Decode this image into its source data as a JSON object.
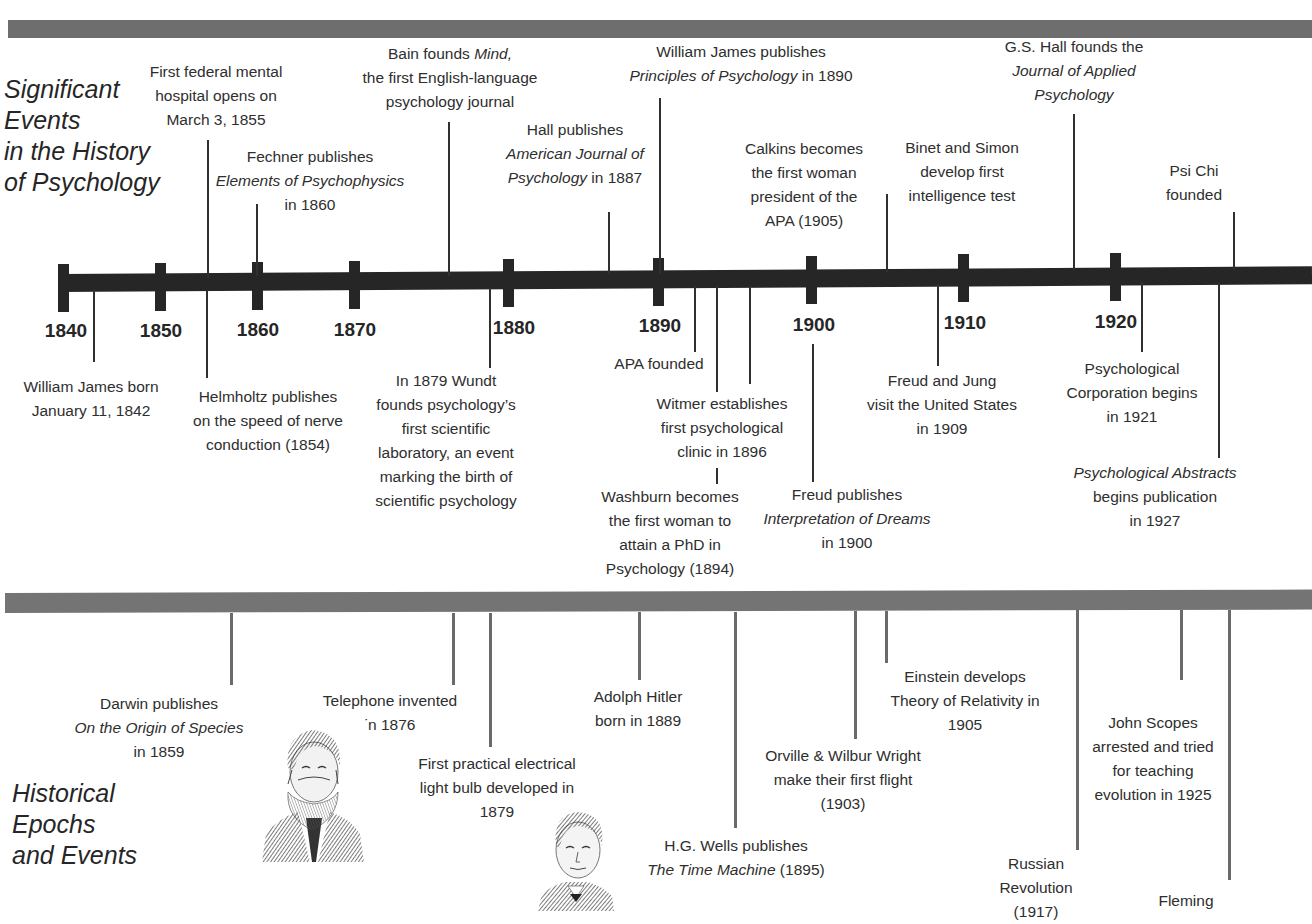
{
  "titles": {
    "psychology": "Significant\nEvents\nin the History\nof Psychology",
    "historical": "Historical\nEpochs\nand Events"
  },
  "colors": {
    "axis": "#262626",
    "band": "#6e6e6e",
    "connector": "#303030",
    "connector_historical": "#6a6a6a",
    "text": "#2e2e2e"
  },
  "chart_data": {
    "type": "timeline",
    "title": "Significant Events in the History of Psychology",
    "axis": {
      "ticks": [
        "1840",
        "1850",
        "1860",
        "1870",
        "1880",
        "1890",
        "1900",
        "1910",
        "1920"
      ],
      "range": [
        1840,
        1930
      ]
    },
    "psychology_events_above": [
      {
        "year": 1855,
        "lines": [
          "First federal mental",
          "hospital opens on",
          "March 3, 1855"
        ]
      },
      {
        "year": 1860,
        "lines": [
          "Fechner publishes",
          "<i>Elements of Psychophysics</i>",
          "in 1860"
        ]
      },
      {
        "year": 1876,
        "lines": [
          "Bain founds <i>Mind,</i>",
          "the first English-language",
          "psychology journal"
        ]
      },
      {
        "year": 1887,
        "lines": [
          "Hall publishes",
          "<i>American Journal of</i>",
          "<i>Psychology</i> in 1887"
        ]
      },
      {
        "year": 1890,
        "lines": [
          "William James publishes",
          "<i>Principles of Psychology</i> in 1890"
        ]
      },
      {
        "year": 1905,
        "lines": [
          "Calkins becomes",
          "the first woman",
          "president of the",
          "APA (1905)"
        ]
      },
      {
        "year": 1905,
        "lines": [
          "Binet and Simon",
          "develop first",
          "intelligence test"
        ]
      },
      {
        "year": 1917,
        "lines": [
          "G.S. Hall founds the",
          "<i>Journal of Applied</i>",
          "<i>Psychology</i>"
        ]
      },
      {
        "year": 1929,
        "lines": [
          "Psi Chi",
          "founded"
        ]
      }
    ],
    "psychology_events_below": [
      {
        "year": 1842,
        "lines": [
          "William James born",
          "January 11, 1842"
        ]
      },
      {
        "year": 1854,
        "lines": [
          "Helmholtz publishes",
          "on the speed of nerve",
          "conduction (1854)"
        ]
      },
      {
        "year": 1879,
        "lines": [
          "In 1879 Wundt",
          "founds psychology’s",
          "first scientific",
          "laboratory, an event",
          "marking the birth of",
          "scientific psychology"
        ]
      },
      {
        "year": 1892,
        "lines": [
          "APA founded"
        ]
      },
      {
        "year": 1896,
        "lines": [
          "Witmer establishes",
          "first psychological",
          "clinic in 1896"
        ]
      },
      {
        "year": 1894,
        "lines": [
          "Washburn becomes",
          "the first woman to",
          "attain a PhD in",
          "Psychology (1894)"
        ]
      },
      {
        "year": 1900,
        "lines": [
          "Freud publishes",
          "<i>Interpretation of Dreams</i>",
          "in 1900"
        ]
      },
      {
        "year": 1909,
        "lines": [
          "Freud and Jung",
          "visit the United States",
          "in 1909"
        ]
      },
      {
        "year": 1921,
        "lines": [
          "Psychological",
          "Corporation begins",
          "in 1921"
        ]
      },
      {
        "year": 1927,
        "lines": [
          "<i>Psychological Abstracts</i>",
          "begins publication",
          "in 1927"
        ]
      }
    ],
    "historical_events": [
      {
        "year": 1859,
        "lines": [
          "Darwin publishes",
          "<i>On the Origin of Species</i>",
          "in 1859"
        ]
      },
      {
        "year": 1876,
        "lines": [
          "Telephone invented",
          "in 1876"
        ]
      },
      {
        "year": 1879,
        "lines": [
          "First practical electrical",
          "light bulb developed in",
          "1879"
        ]
      },
      {
        "year": 1889,
        "lines": [
          "Adolph Hitler",
          "born in 1889"
        ]
      },
      {
        "year": 1895,
        "lines": [
          "H.G. Wells publishes",
          "<i>The Time Machine</i> (1895)"
        ]
      },
      {
        "year": 1903,
        "lines": [
          "Orville &amp; Wilbur Wright",
          "make their first flight",
          "(1903)"
        ]
      },
      {
        "year": 1905,
        "lines": [
          "Einstein develops",
          "Theory of Relativity in",
          "1905"
        ]
      },
      {
        "year": 1917,
        "lines": [
          "Russian",
          "Revolution",
          "(1917)"
        ]
      },
      {
        "year": 1925,
        "lines": [
          "John Scopes",
          "arrested and tried",
          "for teaching",
          "evolution in 1925"
        ]
      },
      {
        "year": 1928,
        "lines": [
          "Fleming"
        ]
      }
    ]
  },
  "portraits": [
    {
      "name": "bearded-man-portrait",
      "caption_near": "Telephone invented"
    },
    {
      "name": "elderly-man-portrait",
      "caption_near": "First practical electrical light bulb"
    }
  ]
}
